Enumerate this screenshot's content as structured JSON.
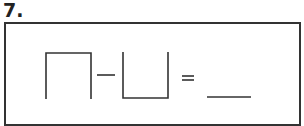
{
  "question": {
    "number": "7.",
    "expression": {
      "left_shape": "cap-shape (∩, three-sided square open at bottom)",
      "operator": "−",
      "right_shape": "cup-shape (∪, three-sided square open at top)",
      "equals": "=",
      "answer_blank": ""
    }
  },
  "colors": {
    "stroke": "#333333",
    "background": "#ffffff"
  }
}
